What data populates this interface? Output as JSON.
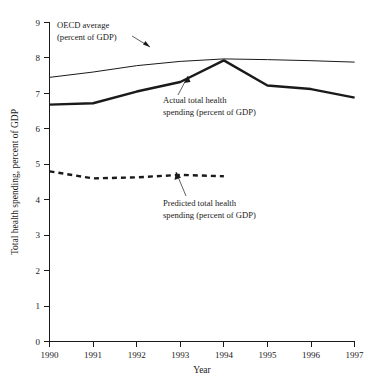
{
  "chart_data": {
    "type": "line",
    "title": "",
    "xlabel": "Year",
    "ylabel": "Total health spending, percent of GDP",
    "x": [
      1990,
      1991,
      1992,
      1993,
      1994,
      1995,
      1996,
      1997
    ],
    "xtick_labels": [
      "1990",
      "1991",
      "1992",
      "1993",
      "1994",
      "1995",
      "1996",
      "1997"
    ],
    "ytick_labels": [
      "0",
      "1",
      "2",
      "3",
      "4",
      "5",
      "6",
      "7",
      "8",
      "9"
    ],
    "xlim": [
      1990,
      1997
    ],
    "ylim": [
      0,
      9
    ],
    "grid": false,
    "legend_position": "annotations-inline",
    "series": [
      {
        "name": "OECD average (percent of GDP)",
        "style": "thin-solid",
        "color": "#1a1a1a",
        "x": [
          1990,
          1991,
          1992,
          1993,
          1994,
          1995,
          1996,
          1997
        ],
        "values": [
          7.45,
          7.6,
          7.78,
          7.9,
          7.97,
          7.95,
          7.92,
          7.88
        ]
      },
      {
        "name": "Actual total health spending (percent of GDP)",
        "style": "thick-solid",
        "color": "#1a1a1a",
        "x": [
          1990,
          1991,
          1992,
          1993,
          1994,
          1995,
          1996,
          1997
        ],
        "values": [
          6.68,
          6.72,
          7.05,
          7.32,
          7.93,
          7.22,
          7.12,
          6.88
        ]
      },
      {
        "name": "Predicted total health spending (percent of GDP)",
        "style": "thick-dashed",
        "color": "#1a1a1a",
        "x": [
          1990,
          1991,
          1992,
          1993,
          1994
        ],
        "values": [
          4.8,
          4.6,
          4.63,
          4.7,
          4.66
        ]
      }
    ],
    "annotations": [
      {
        "id": "oecd-average",
        "line1": "OECD average",
        "line2": "(percent of GDP)"
      },
      {
        "id": "actual-total-health-spending",
        "line1": "Actual total health",
        "line2": "spending (percent of GDP)"
      },
      {
        "id": "predicted-total-health-spending",
        "line1": "Predicted total health",
        "line2": "spending (percent of GDP)"
      }
    ]
  }
}
